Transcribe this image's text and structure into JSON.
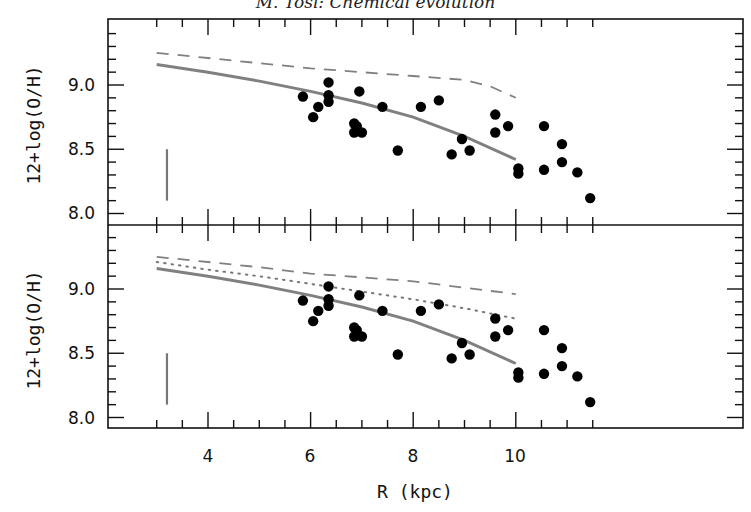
{
  "header": {
    "running_title": "M. Tosi: Chemical evolution"
  },
  "chart_data": [
    {
      "type": "scatter",
      "panel": "upper",
      "title": "",
      "xlabel": "R (kpc)",
      "ylabel": "12+log(O/H)",
      "xlim": [
        2.95,
        11.75
      ],
      "ylim": [
        7.9,
        9.5
      ],
      "xticks": [
        4,
        6,
        8,
        10
      ],
      "yticks": [
        8.0,
        8.5,
        9.0
      ],
      "grid": false,
      "legend": null,
      "error_bar": {
        "x": 3.2,
        "y_low": 8.1,
        "y_high": 8.5,
        "color": "#777777"
      },
      "series": [
        {
          "name": "observed abundances",
          "style": "filled-circle",
          "color": "#000000",
          "points": [
            [
              5.85,
              8.91
            ],
            [
              6.05,
              8.75
            ],
            [
              6.15,
              8.83
            ],
            [
              6.35,
              9.02
            ],
            [
              6.35,
              8.92
            ],
            [
              6.35,
              8.87
            ],
            [
              6.85,
              8.7
            ],
            [
              6.85,
              8.63
            ],
            [
              6.9,
              8.68
            ],
            [
              6.95,
              8.95
            ],
            [
              7.0,
              8.63
            ],
            [
              7.4,
              8.83
            ],
            [
              7.7,
              8.49
            ],
            [
              8.15,
              8.83
            ],
            [
              8.5,
              8.88
            ],
            [
              8.75,
              8.46
            ],
            [
              8.95,
              8.58
            ],
            [
              9.1,
              8.49
            ],
            [
              9.6,
              8.77
            ],
            [
              9.6,
              8.63
            ],
            [
              9.85,
              8.68
            ],
            [
              10.05,
              8.35
            ],
            [
              10.05,
              8.31
            ],
            [
              10.55,
              8.68
            ],
            [
              10.55,
              8.34
            ],
            [
              10.9,
              8.54
            ],
            [
              10.9,
              8.4
            ],
            [
              11.2,
              8.32
            ],
            [
              11.45,
              8.12
            ]
          ]
        },
        {
          "name": "model (solid)",
          "style": "solid",
          "color": "#808080",
          "points": [
            [
              3.0,
              9.16
            ],
            [
              4.0,
              9.1
            ],
            [
              5.0,
              9.03
            ],
            [
              6.0,
              8.95
            ],
            [
              7.0,
              8.86
            ],
            [
              8.0,
              8.75
            ],
            [
              9.0,
              8.6
            ],
            [
              10.0,
              8.42
            ]
          ]
        },
        {
          "name": "model (dashed)",
          "style": "dashed",
          "color": "#808080",
          "points": [
            [
              3.0,
              9.25
            ],
            [
              4.0,
              9.21
            ],
            [
              5.0,
              9.17
            ],
            [
              6.0,
              9.13
            ],
            [
              7.0,
              9.1
            ],
            [
              8.0,
              9.07
            ],
            [
              9.0,
              9.04
            ],
            [
              9.5,
              8.99
            ],
            [
              10.0,
              8.9
            ]
          ]
        }
      ]
    },
    {
      "type": "scatter",
      "panel": "lower",
      "title": "",
      "xlabel": "R (kpc)",
      "ylabel": "12+log(O/H)",
      "xlim": [
        2.95,
        11.75
      ],
      "ylim": [
        7.9,
        9.5
      ],
      "xticks": [
        4,
        6,
        8,
        10
      ],
      "yticks": [
        8.0,
        8.5,
        9.0
      ],
      "grid": false,
      "legend": null,
      "error_bar": {
        "x": 3.2,
        "y_low": 8.1,
        "y_high": 8.5,
        "color": "#777777"
      },
      "series": [
        {
          "name": "observed abundances",
          "style": "filled-circle",
          "color": "#000000",
          "points": [
            [
              5.85,
              8.91
            ],
            [
              6.05,
              8.75
            ],
            [
              6.15,
              8.83
            ],
            [
              6.35,
              9.02
            ],
            [
              6.35,
              8.92
            ],
            [
              6.35,
              8.87
            ],
            [
              6.85,
              8.7
            ],
            [
              6.85,
              8.63
            ],
            [
              6.9,
              8.68
            ],
            [
              6.95,
              8.95
            ],
            [
              7.0,
              8.63
            ],
            [
              7.4,
              8.83
            ],
            [
              7.7,
              8.49
            ],
            [
              8.15,
              8.83
            ],
            [
              8.5,
              8.88
            ],
            [
              8.75,
              8.46
            ],
            [
              8.95,
              8.58
            ],
            [
              9.1,
              8.49
            ],
            [
              9.6,
              8.77
            ],
            [
              9.6,
              8.63
            ],
            [
              9.85,
              8.68
            ],
            [
              10.05,
              8.35
            ],
            [
              10.05,
              8.31
            ],
            [
              10.55,
              8.68
            ],
            [
              10.55,
              8.34
            ],
            [
              10.9,
              8.54
            ],
            [
              10.9,
              8.4
            ],
            [
              11.2,
              8.32
            ],
            [
              11.45,
              8.12
            ]
          ]
        },
        {
          "name": "model (solid)",
          "style": "solid",
          "color": "#808080",
          "points": [
            [
              3.0,
              9.16
            ],
            [
              4.0,
              9.1
            ],
            [
              5.0,
              9.03
            ],
            [
              6.0,
              8.95
            ],
            [
              7.0,
              8.86
            ],
            [
              8.0,
              8.75
            ],
            [
              9.0,
              8.6
            ],
            [
              10.0,
              8.42
            ]
          ]
        },
        {
          "name": "model (dashed)",
          "style": "dashed",
          "color": "#808080",
          "points": [
            [
              3.0,
              9.25
            ],
            [
              4.0,
              9.21
            ],
            [
              5.0,
              9.17
            ],
            [
              6.0,
              9.12
            ],
            [
              7.0,
              9.09
            ],
            [
              8.0,
              9.06
            ],
            [
              9.0,
              9.01
            ],
            [
              10.0,
              8.96
            ]
          ]
        },
        {
          "name": "model (dotted)",
          "style": "dotted",
          "color": "#777777",
          "points": [
            [
              3.0,
              9.21
            ],
            [
              4.0,
              9.15
            ],
            [
              5.0,
              9.1
            ],
            [
              6.0,
              9.04
            ],
            [
              7.0,
              8.98
            ],
            [
              8.0,
              8.92
            ],
            [
              9.0,
              8.85
            ],
            [
              10.0,
              8.77
            ]
          ]
        }
      ]
    }
  ],
  "axes": {
    "x_label": "R (kpc)",
    "y_label_upper": "12+log(O/H)",
    "y_label_lower": "12+log(O/H)",
    "x_tick_labels": [
      "4",
      "6",
      "8",
      "10"
    ],
    "y_tick_labels_upper": [
      "9.0",
      "8.5",
      "8.0"
    ],
    "y_tick_labels_lower": [
      "9.0",
      "8.5",
      "8.0"
    ]
  }
}
